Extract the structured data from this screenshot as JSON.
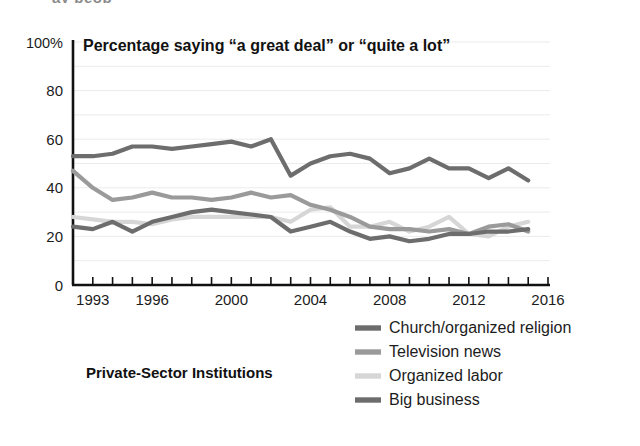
{
  "figure": {
    "cropped_top_text": "ay peop",
    "chart_title": "Percentage saying “a great deal” or “quite a lot”",
    "panel_label": "Private-Sector Institutions"
  },
  "chart_data": {
    "type": "line",
    "title": "Percentage saying “a great deal” or “quite a lot”",
    "subtitle": "Private-Sector Institutions",
    "xlabel": "",
    "ylabel": "",
    "xlim": [
      1992,
      2016
    ],
    "ylim": [
      0,
      100
    ],
    "ytick_labels": [
      "100%",
      "80",
      "60",
      "40",
      "20",
      "0"
    ],
    "ytick_values": [
      100,
      80,
      60,
      40,
      20,
      0
    ],
    "xtick_labels": [
      "1993",
      "1996",
      "2000",
      "2004",
      "2008",
      "2012",
      "2016"
    ],
    "xtick_values": [
      1993,
      1996,
      2000,
      2004,
      2008,
      2012,
      2016
    ],
    "x": [
      1992,
      1993,
      1994,
      1995,
      1996,
      1997,
      1998,
      1999,
      2000,
      2001,
      2002,
      2003,
      2004,
      2005,
      2006,
      2007,
      2008,
      2009,
      2010,
      2011,
      2012,
      2013,
      2014,
      2015
    ],
    "grid": true,
    "grid_interval": 10,
    "legend_position": "bottom-right",
    "series": [
      {
        "name": "Church/organized religion",
        "color": "#6d6d6d",
        "stroke_width": 4.2,
        "values": [
          53,
          53,
          54,
          57,
          57,
          56,
          57,
          58,
          59,
          57,
          60,
          45,
          50,
          53,
          54,
          52,
          46,
          48,
          52,
          48,
          48,
          44,
          48,
          43
        ]
      },
      {
        "name": "Television news",
        "color": "#9a9a9a",
        "stroke_width": 4.2,
        "values": [
          47,
          40,
          35,
          36,
          38,
          36,
          36,
          35,
          36,
          38,
          36,
          37,
          33,
          31,
          28,
          24,
          23,
          23,
          22,
          23,
          21,
          24,
          25,
          22
        ]
      },
      {
        "name": "Organized labor",
        "color": "#d6d6d6",
        "stroke_width": 4.2,
        "values": [
          28,
          27,
          26,
          26,
          25,
          27,
          28,
          28,
          28,
          28,
          28,
          26,
          31,
          32,
          24,
          24,
          26,
          22,
          24,
          28,
          21,
          20,
          24,
          26
        ]
      },
      {
        "name": "Big business",
        "color": "#6d6d6d",
        "stroke_width": 4.2,
        "values": [
          24,
          23,
          26,
          22,
          26,
          28,
          30,
          31,
          30,
          29,
          28,
          22,
          24,
          26,
          22,
          19,
          20,
          18,
          19,
          21,
          21,
          22,
          22,
          23
        ]
      }
    ]
  }
}
